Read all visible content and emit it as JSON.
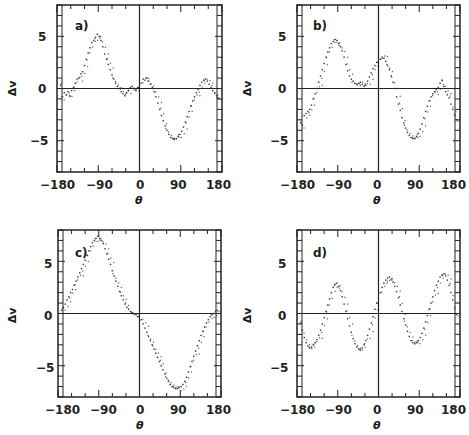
{
  "figure": {
    "background": "#ffffff",
    "axis_color": "#222222",
    "point_color": "#333333"
  },
  "chart_data": [
    {
      "type": "scatter",
      "panel": "a)",
      "title": "",
      "xlabel": "θ",
      "ylabel": "Δv",
      "xlim": [
        -180,
        180
      ],
      "ylim": [
        -8,
        8
      ],
      "xticks": [
        -180,
        -90,
        0,
        90,
        180
      ],
      "xtick_labels": [
        "−180",
        "−90",
        "0",
        "90",
        "180"
      ],
      "yticks": [
        5,
        0,
        -5
      ],
      "ytick_labels": [
        "5",
        "0",
        "−5"
      ],
      "grid": false,
      "zero_lines": true,
      "x": [
        -172,
        -168,
        -164,
        -160,
        -156,
        -152,
        -148,
        -144,
        -140,
        -136,
        -132,
        -128,
        -124,
        -120,
        -116,
        -112,
        -108,
        -104,
        -100,
        -96,
        -92,
        -88,
        -84,
        -80,
        -76,
        -72,
        -68,
        -64,
        -60,
        -56,
        -52,
        -48,
        -44,
        -40,
        -36,
        -32,
        -28,
        -24,
        -20,
        -16,
        -12,
        -8,
        -4,
        4,
        8,
        12,
        16,
        20,
        24,
        28,
        32,
        36,
        40,
        44,
        48,
        52,
        56,
        60,
        64,
        68,
        72,
        76,
        80,
        84,
        88,
        92,
        96,
        100,
        104,
        108,
        112,
        116,
        120,
        124,
        128,
        132,
        136,
        140,
        144,
        148,
        152,
        156,
        160,
        164,
        168,
        172
      ],
      "y": [
        0.3,
        -0.8,
        -0.4,
        -0.6,
        -0.3,
        -0.7,
        -0.2,
        0.1,
        0.5,
        0.9,
        1.0,
        1.4,
        1.6,
        2.2,
        2.8,
        3.4,
        3.9,
        4.4,
        4.6,
        4.9,
        5.2,
        5.0,
        4.6,
        4.0,
        3.3,
        2.8,
        2.3,
        1.8,
        1.3,
        0.9,
        0.5,
        0.2,
        0.0,
        -0.3,
        -0.5,
        -0.7,
        -0.4,
        -0.2,
        0.1,
        0.2,
        0.0,
        -0.2,
        0.1,
        0.5,
        0.9,
        0.8,
        1.0,
        0.7,
        0.4,
        0.1,
        -0.3,
        -0.8,
        -1.4,
        -2.0,
        -2.6,
        -3.1,
        -3.6,
        -4.0,
        -4.4,
        -4.7,
        -4.8,
        -4.9,
        -4.8,
        -4.6,
        -4.4,
        -4.1,
        -3.7,
        -3.2,
        -2.7,
        -2.2,
        -1.7,
        -1.2,
        -0.8,
        -0.4,
        -0.1,
        0.3,
        0.6,
        0.8,
        0.9,
        0.7,
        0.4,
        0.1,
        -0.2,
        -0.4,
        -0.7,
        -0.9
      ]
    },
    {
      "type": "scatter",
      "panel": "b)",
      "title": "",
      "xlabel": "θ",
      "ylabel": "Δv",
      "xlim": [
        -180,
        180
      ],
      "ylim": [
        -8,
        8
      ],
      "xticks": [
        -180,
        -90,
        0,
        90,
        180
      ],
      "xtick_labels": [
        "−180",
        "−90",
        "0",
        "90",
        "180"
      ],
      "yticks": [
        5,
        0,
        -5
      ],
      "ytick_labels": [
        "5",
        "0",
        "−5"
      ],
      "grid": false,
      "zero_lines": true,
      "x": [
        -172,
        -168,
        -164,
        -160,
        -156,
        -152,
        -148,
        -144,
        -140,
        -136,
        -132,
        -128,
        -124,
        -120,
        -116,
        -112,
        -108,
        -104,
        -100,
        -96,
        -92,
        -88,
        -84,
        -80,
        -76,
        -72,
        -68,
        -64,
        -60,
        -56,
        -52,
        -48,
        -44,
        -40,
        -36,
        -32,
        -28,
        -24,
        -20,
        -16,
        -12,
        -8,
        -4,
        4,
        8,
        12,
        16,
        20,
        24,
        28,
        32,
        36,
        40,
        44,
        48,
        52,
        56,
        60,
        64,
        68,
        72,
        76,
        80,
        84,
        88,
        92,
        96,
        100,
        104,
        108,
        112,
        116,
        120,
        124,
        128,
        132,
        136,
        140,
        144,
        148,
        152,
        156,
        160,
        164,
        168,
        172
      ],
      "y": [
        -3.3,
        -3.5,
        -2.6,
        -2.4,
        -2.2,
        -2.0,
        -1.6,
        -1.0,
        -0.5,
        0.0,
        0.6,
        1.2,
        1.8,
        2.4,
        3.0,
        3.5,
        3.9,
        4.3,
        4.5,
        4.7,
        4.6,
        4.3,
        4.0,
        3.6,
        3.0,
        2.3,
        1.7,
        1.2,
        0.9,
        0.7,
        0.5,
        0.4,
        0.5,
        0.6,
        0.4,
        0.2,
        0.3,
        0.7,
        1.1,
        1.5,
        1.9,
        2.2,
        2.5,
        2.8,
        3.0,
        2.9,
        2.6,
        2.2,
        1.8,
        1.2,
        0.6,
        0.0,
        -0.8,
        -1.5,
        -2.1,
        -2.8,
        -3.3,
        -3.8,
        -4.2,
        -4.5,
        -4.7,
        -4.8,
        -4.8,
        -4.6,
        -4.3,
        -3.9,
        -3.4,
        -2.8,
        -2.2,
        -1.7,
        -1.2,
        -0.8,
        -0.5,
        -0.3,
        -0.1,
        0.1,
        0.5,
        0.8,
        0.2,
        -0.3,
        -0.6,
        -0.9,
        -1.5,
        -2.0,
        -2.5,
        -3.0
      ]
    },
    {
      "type": "scatter",
      "panel": "c)",
      "title": "",
      "xlabel": "θ",
      "ylabel": "Δv",
      "xlim": [
        -180,
        180
      ],
      "ylim": [
        -8,
        8
      ],
      "xticks": [
        -180,
        -90,
        0,
        90,
        180
      ],
      "xtick_labels": [
        "−180",
        "−90",
        "0",
        "90",
        "180"
      ],
      "yticks": [
        5,
        0,
        -5
      ],
      "ytick_labels": [
        "5",
        "0",
        "−5"
      ],
      "grid": false,
      "zero_lines": true,
      "x": [
        -172,
        -168,
        -164,
        -160,
        -156,
        -152,
        -148,
        -144,
        -140,
        -136,
        -132,
        -128,
        -124,
        -120,
        -116,
        -112,
        -108,
        -104,
        -100,
        -96,
        -92,
        -88,
        -84,
        -80,
        -76,
        -72,
        -68,
        -64,
        -60,
        -56,
        -52,
        -48,
        -44,
        -40,
        -36,
        -32,
        -28,
        -24,
        -20,
        -16,
        -12,
        -8,
        -4,
        4,
        8,
        12,
        16,
        20,
        24,
        28,
        32,
        36,
        40,
        44,
        48,
        52,
        56,
        60,
        64,
        68,
        72,
        76,
        80,
        84,
        88,
        92,
        96,
        100,
        104,
        108,
        112,
        116,
        120,
        124,
        128,
        132,
        136,
        140,
        144,
        148,
        152,
        156,
        160,
        164,
        168,
        172
      ],
      "y": [
        0.3,
        0.6,
        0.9,
        1.3,
        1.6,
        2.0,
        2.3,
        2.7,
        3.1,
        3.5,
        3.9,
        4.3,
        4.7,
        5.1,
        5.6,
        6.0,
        6.4,
        6.8,
        7.0,
        7.2,
        7.4,
        7.2,
        7.0,
        6.7,
        6.2,
        5.7,
        5.2,
        4.7,
        4.1,
        3.6,
        3.1,
        2.6,
        2.1,
        1.7,
        1.3,
        0.9,
        0.6,
        0.4,
        0.2,
        0.1,
        0.0,
        -0.1,
        -0.3,
        -0.6,
        -1.0,
        -1.4,
        -1.8,
        -2.2,
        -2.6,
        -3.0,
        -3.4,
        -3.8,
        -4.2,
        -4.6,
        -5.0,
        -5.4,
        -5.8,
        -6.2,
        -6.5,
        -6.8,
        -7.0,
        -7.1,
        -7.2,
        -7.2,
        -7.1,
        -7.0,
        -6.8,
        -6.5,
        -6.1,
        -5.6,
        -5.1,
        -4.6,
        -4.1,
        -3.6,
        -3.1,
        -2.6,
        -2.1,
        -1.7,
        -1.3,
        -0.9,
        -0.6,
        -0.3,
        -0.1,
        0.0,
        0.2,
        0.3
      ]
    },
    {
      "type": "scatter",
      "panel": "d)",
      "title": "",
      "xlabel": "θ",
      "ylabel": "Δv",
      "xlim": [
        -180,
        180
      ],
      "ylim": [
        -8,
        8
      ],
      "xticks": [
        -180,
        -90,
        0,
        90,
        180
      ],
      "xtick_labels": [
        "−180",
        "−90",
        "0",
        "90",
        "180"
      ],
      "yticks": [
        5,
        0,
        -5
      ],
      "ytick_labels": [
        "5",
        "0",
        "−5"
      ],
      "grid": false,
      "zero_lines": true,
      "x": [
        -172,
        -168,
        -164,
        -160,
        -156,
        -152,
        -148,
        -144,
        -140,
        -136,
        -132,
        -128,
        -124,
        -120,
        -116,
        -112,
        -108,
        -104,
        -100,
        -96,
        -92,
        -88,
        -84,
        -80,
        -76,
        -72,
        -68,
        -64,
        -60,
        -56,
        -52,
        -48,
        -44,
        -40,
        -36,
        -32,
        -28,
        -24,
        -20,
        -16,
        -12,
        -8,
        -4,
        4,
        8,
        12,
        16,
        20,
        24,
        28,
        32,
        36,
        40,
        44,
        48,
        52,
        56,
        60,
        64,
        68,
        72,
        76,
        80,
        84,
        88,
        92,
        96,
        100,
        104,
        108,
        112,
        116,
        120,
        124,
        128,
        132,
        136,
        140,
        144,
        148,
        152,
        156,
        160,
        164,
        168,
        172
      ],
      "y": [
        -0.9,
        -1.6,
        -2.3,
        -2.8,
        -3.1,
        -3.3,
        -3.2,
        -3.0,
        -2.8,
        -2.5,
        -2.1,
        -1.6,
        -1.0,
        -0.4,
        0.2,
        0.8,
        1.4,
        2.0,
        2.5,
        2.8,
        2.9,
        2.6,
        2.2,
        1.6,
        0.9,
        0.2,
        -0.5,
        -1.2,
        -1.8,
        -2.4,
        -2.9,
        -3.2,
        -3.4,
        -3.5,
        -3.3,
        -3.0,
        -2.6,
        -2.1,
        -1.5,
        -0.9,
        -0.3,
        0.4,
        1.0,
        2.0,
        2.5,
        2.9,
        3.2,
        3.4,
        3.5,
        3.3,
        3.0,
        2.6,
        2.1,
        1.5,
        0.8,
        0.2,
        -0.5,
        -1.1,
        -1.7,
        -2.2,
        -2.6,
        -2.8,
        -2.9,
        -2.8,
        -2.6,
        -2.3,
        -1.9,
        -1.4,
        -0.8,
        -0.2,
        0.4,
        1.0,
        1.6,
        2.2,
        2.7,
        3.1,
        3.5,
        3.7,
        3.8,
        3.6,
        3.2,
        2.7,
        2.0,
        1.3,
        0.6,
        -0.1
      ]
    }
  ],
  "panels": [
    {
      "tag": "a)",
      "xlabel": "θ",
      "ylabel": "Δv",
      "xtick_labels": [
        "−180",
        "−90",
        "0",
        "90",
        "180"
      ],
      "ytick_labels": [
        "5",
        "0",
        "−5"
      ]
    },
    {
      "tag": "b)",
      "xlabel": "θ",
      "ylabel": "Δv",
      "xtick_labels": [
        "−180",
        "−90",
        "0",
        "90",
        "180"
      ],
      "ytick_labels": [
        "5",
        "0",
        "−5"
      ]
    },
    {
      "tag": "c)",
      "xlabel": "θ",
      "ylabel": "Δv",
      "xtick_labels": [
        "−180",
        "−90",
        "0",
        "90",
        "180"
      ],
      "ytick_labels": [
        "5",
        "0",
        "−5"
      ]
    },
    {
      "tag": "d)",
      "xlabel": "θ",
      "ylabel": "Δv",
      "xtick_labels": [
        "−180",
        "−90",
        "0",
        "90",
        "180"
      ],
      "ytick_labels": [
        "5",
        "0",
        "−5"
      ]
    }
  ]
}
